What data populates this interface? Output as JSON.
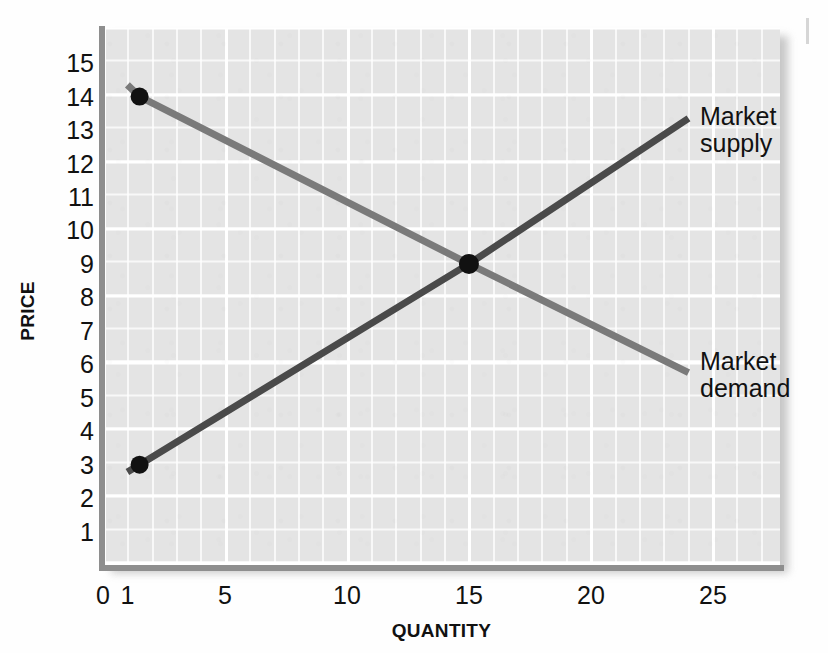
{
  "figure": {
    "background_color": "#fefefe",
    "panel_color": "#e4e4e4",
    "gridline_color": "#ffffff",
    "axis_color": "#8e8e8e"
  },
  "axes": {
    "x_title": "QUANTITY",
    "y_title": "PRICE"
  },
  "labels": {
    "supply": "Market\nsupply",
    "demand": "Market\ndemand"
  },
  "chart_data": {
    "type": "line",
    "title": "",
    "subtitle": "",
    "xlabel": "QUANTITY",
    "ylabel": "PRICE",
    "xlim": [
      0,
      27.75
    ],
    "ylim": [
      0,
      16.05
    ],
    "x_ticks": [
      0,
      1,
      5,
      10,
      15,
      20,
      25
    ],
    "x_tick_labels": [
      "0",
      "1",
      "5",
      "10",
      "15",
      "20",
      "25"
    ],
    "y_ticks": [
      1,
      2,
      3,
      4,
      5,
      6,
      7,
      8,
      9,
      10,
      11,
      12,
      13,
      14,
      15
    ],
    "y_tick_labels": [
      "1",
      "2",
      "3",
      "4",
      "5",
      "6",
      "7",
      "8",
      "9",
      "10",
      "11",
      "12",
      "13",
      "14",
      "15"
    ],
    "grid": true,
    "grid_minor": true,
    "legend": "inline-callout",
    "legend_position": "right-of-line-ends",
    "series": [
      {
        "name": "Market demand",
        "color": "#7a7a7a",
        "linewidth": 7,
        "points": [
          {
            "x": 1.0,
            "y": 14.35
          },
          {
            "x": 1.5,
            "y": 14.0
          },
          {
            "x": 15.0,
            "y": 9.0
          },
          {
            "x": 24.0,
            "y": 5.75
          }
        ],
        "markers": [
          {
            "x": 1.5,
            "y": 14.0,
            "color": "#111111",
            "radius": 9
          }
        ],
        "label_text": "Market\ndemand",
        "label_at": {
          "x": 24.5,
          "y": 5.6
        }
      },
      {
        "name": "Market supply",
        "color": "#4a4a4a",
        "linewidth": 7,
        "points": [
          {
            "x": 1.0,
            "y": 2.78
          },
          {
            "x": 1.5,
            "y": 3.0
          },
          {
            "x": 15.0,
            "y": 9.0
          },
          {
            "x": 24.0,
            "y": 13.35
          }
        ],
        "markers": [
          {
            "x": 1.5,
            "y": 3.0,
            "color": "#111111",
            "radius": 9
          }
        ],
        "label_text": "Market\nsupply",
        "label_at": {
          "x": 24.5,
          "y": 13.5
        }
      }
    ],
    "annotations": [
      {
        "name": "equilibrium-point",
        "x": 15.0,
        "y": 9.0,
        "marker": "filled-circle",
        "color": "#111111",
        "radius": 10,
        "text": ""
      }
    ]
  }
}
